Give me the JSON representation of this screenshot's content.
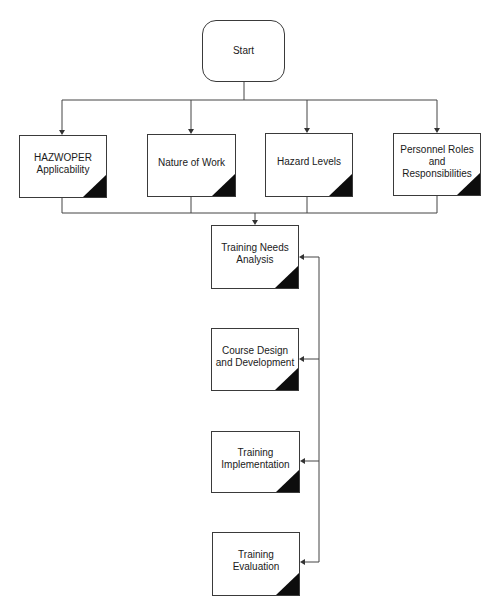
{
  "diagram": {
    "type": "flowchart",
    "start": {
      "label": "Start"
    },
    "inputs": [
      {
        "label": "HAZWOPER\nApplicability"
      },
      {
        "label": "Nature of Work"
      },
      {
        "label": "Hazard Levels"
      },
      {
        "label": "Personnel Roles\nand\nResponsibilities"
      }
    ],
    "process": [
      {
        "label": "Training Needs\nAnalysis"
      },
      {
        "label": "Course Design\nand Development"
      },
      {
        "label": "Training\nImplementation"
      },
      {
        "label": "Training\nEvaluation"
      }
    ],
    "colors": {
      "line": "#444444",
      "corner_marker": "#0d0d0d",
      "box_border": "#3a3a3a",
      "background": "#ffffff"
    }
  }
}
